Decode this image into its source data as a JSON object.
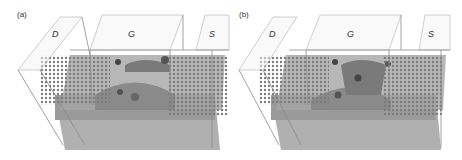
{
  "figure": {
    "panels": [
      {
        "label": "(a)",
        "regions": {
          "drain": "D",
          "gate": "G",
          "source": "S"
        }
      },
      {
        "label": "(b)",
        "regions": {
          "drain": "D",
          "gate": "G",
          "source": "S"
        }
      }
    ],
    "colors": {
      "box_outline": "#8a8a8a",
      "box_fill": "#f2f2f2",
      "channel_surface": "#8f8f8f",
      "channel_dark": "#6e6e6e",
      "dopant_dots": "#777777",
      "lower_slab": "#a8a8a8"
    }
  }
}
